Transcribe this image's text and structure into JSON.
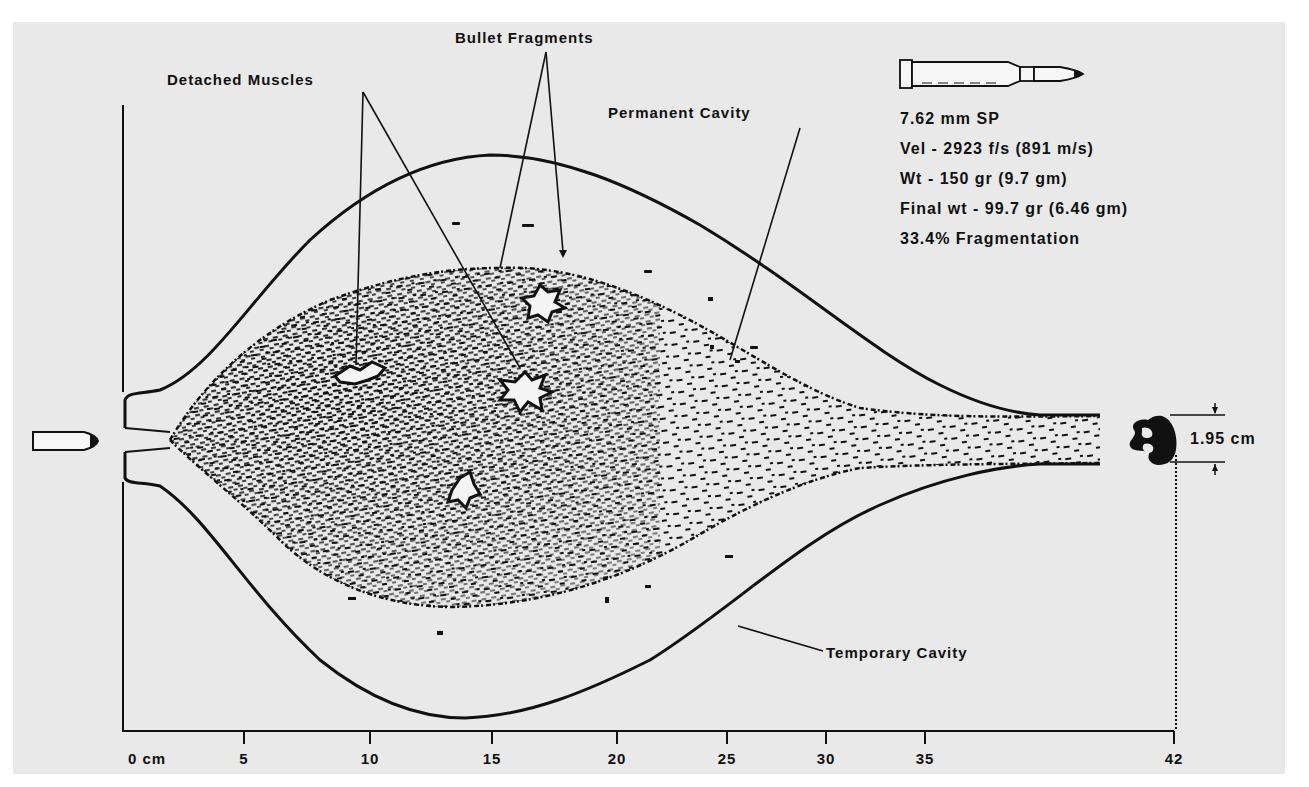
{
  "labels": {
    "detached_muscles": "Detached Muscles",
    "bullet_fragments": "Bullet Fragments",
    "permanent_cavity": "Permanent Cavity",
    "temporary_cavity": "Temporary Cavity",
    "exit_diameter": "1.95 cm"
  },
  "specs": {
    "caliber": "7.62 mm SP",
    "velocity": "Vel - 2923 f/s  (891 m/s)",
    "weight": "Wt - 150 gr  (9.7 gm)",
    "final_weight": "Final wt - 99.7 gr   (6.46 gm)",
    "fragmentation": "33.4% Fragmentation"
  },
  "axis": {
    "ticks": [
      {
        "value": 0,
        "label": "0  cm"
      },
      {
        "value": 5,
        "label": "5"
      },
      {
        "value": 10,
        "label": "10"
      },
      {
        "value": 15,
        "label": "15"
      },
      {
        "value": 20,
        "label": "20"
      },
      {
        "value": 25,
        "label": "25"
      },
      {
        "value": 30,
        "label": "30"
      },
      {
        "value": 35,
        "label": "35"
      },
      {
        "value": 42,
        "label": "42"
      }
    ],
    "unit": "cm",
    "max": 42
  },
  "icons": {
    "cartridge": "rifle-cartridge-icon",
    "bullet": "bullet-icon",
    "deformed_bullet": "deformed-bullet-icon"
  },
  "colors": {
    "background": "#e9e9e9",
    "ink": "#111111"
  }
}
